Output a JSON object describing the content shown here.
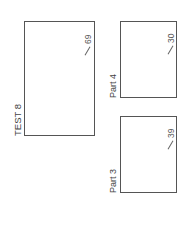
{
  "test": {
    "label": "TEST 8",
    "max_score": "69"
  },
  "parts": [
    {
      "label": "Part 4",
      "max_score": "30"
    },
    {
      "label": "Part 3",
      "max_score": "39"
    }
  ]
}
